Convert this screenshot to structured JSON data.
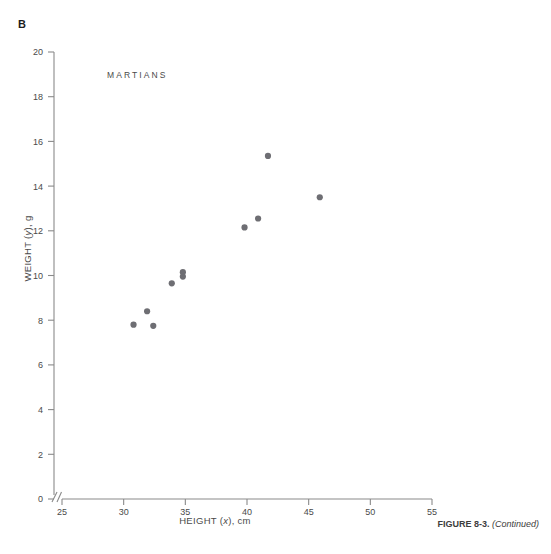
{
  "panel": {
    "label": "B"
  },
  "figure": {
    "caption_bold": "FIGURE 8-3.",
    "caption_italic": "(Continued)"
  },
  "chart_data": {
    "type": "scatter",
    "title": "MARTIANS",
    "xlabel_prefix": "HEIGHT (",
    "xlabel_var": "x",
    "xlabel_suffix": "), cm",
    "ylabel_prefix": "WEIGHT (",
    "ylabel_var": "y",
    "ylabel_suffix": "), g",
    "xlim": [
      25,
      55
    ],
    "ylim": [
      0,
      20
    ],
    "xticks": [
      25,
      30,
      35,
      40,
      45,
      50,
      55
    ],
    "yticks": [
      0,
      2,
      4,
      6,
      8,
      10,
      12,
      14,
      16,
      18,
      20
    ],
    "xtick_labels": [
      "25",
      "30",
      "35",
      "40",
      "45",
      "50",
      "55"
    ],
    "ytick_labels": [
      "0",
      "2",
      "4",
      "6",
      "8",
      "10",
      "12",
      "14",
      "16",
      "18",
      "20"
    ],
    "grid": false,
    "legend": "none",
    "axis_break_x": true,
    "axis_break_symbol": "//",
    "marker": {
      "shape": "circle",
      "color": "#6e6e73",
      "radius": 3.1
    },
    "axis_color": "#8a8a8a",
    "x": [
      30.8,
      31.9,
      32.4,
      33.9,
      34.8,
      34.8,
      39.8,
      40.9,
      41.7,
      45.9
    ],
    "y": [
      7.8,
      8.4,
      7.75,
      9.65,
      10.15,
      9.95,
      12.15,
      12.55,
      15.35,
      13.5
    ],
    "points": [
      {
        "x": 30.8,
        "y": 7.8
      },
      {
        "x": 31.9,
        "y": 8.4
      },
      {
        "x": 32.4,
        "y": 7.75
      },
      {
        "x": 33.9,
        "y": 9.65
      },
      {
        "x": 34.8,
        "y": 10.15
      },
      {
        "x": 34.8,
        "y": 9.95
      },
      {
        "x": 39.8,
        "y": 12.15
      },
      {
        "x": 40.9,
        "y": 12.55
      },
      {
        "x": 41.7,
        "y": 15.35
      },
      {
        "x": 45.9,
        "y": 13.5
      }
    ]
  }
}
